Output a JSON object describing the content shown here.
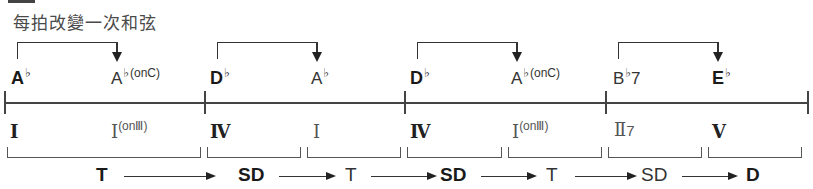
{
  "caption": "每拍改變一次和弦",
  "chords": [
    {
      "root": "A",
      "accidental": "♭",
      "suffix": "",
      "bold": true
    },
    {
      "root": "A",
      "accidental": "♭",
      "suffix": "(onC)",
      "bold": false
    },
    {
      "root": "D",
      "accidental": "♭",
      "suffix": "",
      "bold": true
    },
    {
      "root": "A",
      "accidental": "♭",
      "suffix": "",
      "bold": false
    },
    {
      "root": "D",
      "accidental": "♭",
      "suffix": "",
      "bold": true
    },
    {
      "root": "A",
      "accidental": "♭",
      "suffix": "(onC)",
      "bold": false
    },
    {
      "root": "B",
      "accidental": "♭",
      "suffix": "7",
      "bold": false
    },
    {
      "root": "E",
      "accidental": "♭",
      "suffix": "",
      "bold": true
    }
  ],
  "roman_numerals": [
    {
      "numeral": "I",
      "sup": "",
      "bold": true
    },
    {
      "numeral": "I",
      "sup": "(onⅢ)",
      "bold": false
    },
    {
      "numeral": "Ⅳ",
      "sup": "",
      "bold": true
    },
    {
      "numeral": "I",
      "sup": "",
      "bold": false
    },
    {
      "numeral": "Ⅳ",
      "sup": "",
      "bold": true
    },
    {
      "numeral": "I",
      "sup": "(onⅢ)",
      "bold": false
    },
    {
      "numeral": "Ⅱ",
      "sup": "7",
      "bold": false
    },
    {
      "numeral": "Ⅴ",
      "sup": "",
      "bold": true
    }
  ],
  "functions": [
    {
      "label": "T",
      "bold": true
    },
    {
      "label": "SD",
      "bold": true
    },
    {
      "label": "T",
      "bold": false
    },
    {
      "label": "SD",
      "bold": true
    },
    {
      "label": "T",
      "bold": false
    },
    {
      "label": "SD",
      "bold": false
    },
    {
      "label": "D",
      "bold": true
    }
  ],
  "measures": 4,
  "colors": {
    "line": "#444444",
    "text": "#2a2a2a"
  }
}
